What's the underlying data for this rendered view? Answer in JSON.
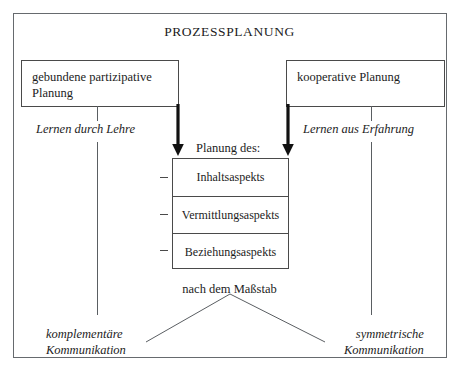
{
  "diagram": {
    "title": "PROZESSPLANUNG",
    "frame_color": "#666a6e",
    "line_color": "#4a4a4a",
    "text_color": "#1c1c1c"
  },
  "top_boxes": [
    {
      "id": "gebundene-partizipative-planung",
      "line1": "gebundene partizipative",
      "line2": "Planung"
    },
    {
      "id": "kooperative-planung",
      "line1": "kooperative Planung",
      "line2": ""
    }
  ],
  "branch_labels": [
    {
      "id": "lernen-durch-lehre",
      "text": "Lernen durch Lehre"
    },
    {
      "id": "lernen-aus-erfahrung",
      "text": "Lernen aus Erfahrung"
    }
  ],
  "center": {
    "caption": "Planung des:",
    "aspects": [
      "Inhaltsaspekts",
      "Vermittlungsaspekts",
      "Beziehungsaspekts"
    ]
  },
  "scale": {
    "caption": "nach dem Maßstab"
  },
  "outcomes": [
    {
      "id": "komplementaere-kommunikation",
      "line1": "komplementäre",
      "line2": "Kommunikation"
    },
    {
      "id": "symmetrische-kommunikation",
      "line1": "symmetrische",
      "line2": "Kommunikation"
    }
  ],
  "icons": {
    "down_arrow_left": "thick-down-arrow-icon",
    "down_arrow_right": "thick-down-arrow-icon"
  }
}
